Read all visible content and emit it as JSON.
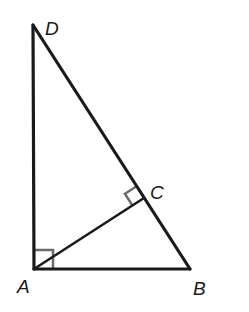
{
  "diagram": {
    "type": "geometry",
    "colors": {
      "line": "#1a1a1a",
      "marker": "#6b6b6b",
      "background": "#ffffff"
    },
    "points": {
      "A": {
        "label": "A",
        "x": 34,
        "y": 269
      },
      "B": {
        "label": "B",
        "x": 190,
        "y": 269
      },
      "C": {
        "label": "C",
        "x": 144,
        "y": 198
      },
      "D": {
        "label": "D",
        "x": 33,
        "y": 25
      }
    },
    "segments": [
      "AD",
      "AB",
      "DB",
      "AC"
    ],
    "right_angles": [
      "DAB",
      "ACD"
    ]
  }
}
